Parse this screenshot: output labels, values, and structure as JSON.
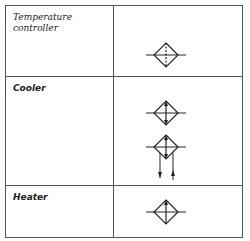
{
  "rows": [
    {
      "label": "Temperature controller",
      "label_lines": [
        "Temperature",
        "controller"
      ],
      "symbols": [
        "diamond-dashed-vertical"
      ]
    },
    {
      "label": "Cooler",
      "symbols": [
        "diamond-double-arrow",
        "diamond-double-arrow-with-flow-arrows"
      ]
    },
    {
      "label": "Heater",
      "symbols": [
        "diamond-up-arrow"
      ]
    }
  ],
  "colors": {
    "line": "#555555",
    "symbol": "#222222",
    "background": "#ffffff"
  }
}
